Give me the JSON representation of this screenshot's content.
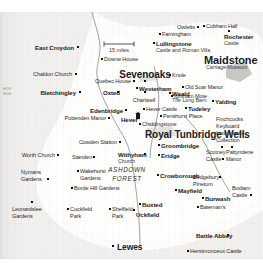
{
  "map": {
    "title": "South East England historic houses map",
    "region_label": "ASHDOWN FOREST",
    "scale": "15 miles",
    "margin_note": "HOV\nHOU",
    "colors": {
      "paper": "#f1f0ee",
      "land": "#fdfdfc",
      "text": "#1b1b1b",
      "road": "#9a9a96",
      "urban": "#b9b8b4"
    },
    "places": [
      {
        "name": "East Croydon",
        "x": 74,
        "y": 45,
        "class": "t-town",
        "align": "r",
        "marker": "dot",
        "mx": 77,
        "my": 46
      },
      {
        "name": "Downe House",
        "x": 104,
        "y": 57,
        "class": "t-site",
        "align": "l",
        "marker": "dot",
        "mx": 101,
        "my": 58
      },
      {
        "name": "Farningham",
        "x": 162,
        "y": 32,
        "class": "t-site",
        "align": "l",
        "marker": "dot",
        "mx": 159,
        "my": 33
      },
      {
        "name": "Owletts",
        "x": 195,
        "y": 25,
        "class": "t-site",
        "align": "r",
        "marker": "dot",
        "mx": 197,
        "my": 26
      },
      {
        "name": "Cobham Hall",
        "x": 206,
        "y": 24,
        "class": "t-site",
        "align": "l",
        "marker": "dot",
        "mx": 203,
        "my": 25
      },
      {
        "name": "Rochester",
        "x": 224,
        "y": 34,
        "class": "t-town",
        "align": "l",
        "marker": "dotb",
        "mx": 228,
        "my": 30
      },
      {
        "name": "Castle",
        "x": 224,
        "y": 41,
        "class": "t-sub",
        "align": "l",
        "marker": "none",
        "mx": 0,
        "my": 0
      },
      {
        "name": "Lullingstone",
        "x": 156,
        "y": 41,
        "class": "t-town",
        "align": "l",
        "marker": "dotb",
        "mx": 153,
        "my": 42
      },
      {
        "name": "Castle and Roman Villa",
        "x": 156,
        "y": 48,
        "class": "t-sub",
        "align": "l",
        "marker": "none",
        "mx": 0,
        "my": 0
      },
      {
        "name": "Maidstone",
        "x": 204,
        "y": 55,
        "class": "t-bigger",
        "align": "l",
        "marker": "none",
        "mx": 0,
        "my": 0
      },
      {
        "name": "Carriage Museum",
        "x": 206,
        "y": 65,
        "class": "t-sub",
        "align": "l",
        "marker": "none",
        "mx": 0,
        "my": 0
      },
      {
        "name": "Chaldon Church",
        "x": 72,
        "y": 72,
        "class": "t-site",
        "align": "r",
        "marker": "dot",
        "mx": 75,
        "my": 73
      },
      {
        "name": "Sevenoaks",
        "x": 145,
        "y": 70,
        "class": "t-big",
        "align": "c",
        "marker": "dotb",
        "mx": 144,
        "my": 80
      },
      {
        "name": "Knole",
        "x": 172,
        "y": 73,
        "class": "t-site",
        "align": "l",
        "marker": "dot",
        "mx": 169,
        "my": 74
      },
      {
        "name": "Quebec House",
        "x": 131,
        "y": 79,
        "class": "t-site",
        "align": "r",
        "marker": "dot",
        "mx": 133,
        "my": 80
      },
      {
        "name": "Westerham",
        "x": 139,
        "y": 86,
        "class": "t-town",
        "align": "l",
        "marker": "dot",
        "mx": 136,
        "my": 87
      },
      {
        "name": "Old Soar Manor",
        "x": 185,
        "y": 85,
        "class": "t-site",
        "align": "l",
        "marker": "dot",
        "mx": 182,
        "my": 86
      },
      {
        "name": "Ightham Mote",
        "x": 174,
        "y": 94,
        "class": "t-site",
        "align": "l",
        "marker": "dot",
        "mx": 171,
        "my": 95
      },
      {
        "name": "Bletchingley",
        "x": 76,
        "y": 90,
        "class": "t-town",
        "align": "r",
        "marker": "dot",
        "mx": 79,
        "my": 91
      },
      {
        "name": "Oxted",
        "x": 103,
        "y": 90,
        "class": "t-town",
        "align": "l",
        "marker": "dot",
        "mx": 117,
        "my": 91
      },
      {
        "name": "Chartwell",
        "x": 144,
        "y": 98,
        "class": "t-site",
        "align": "c",
        "marker": "dotb",
        "mx": 144,
        "my": 91
      },
      {
        "name": "Weald",
        "x": 172,
        "y": 91,
        "class": "t-town",
        "align": "l",
        "marker": "dotb",
        "mx": 169,
        "my": 92
      },
      {
        "name": "The Long Barn",
        "x": 172,
        "y": 98,
        "class": "t-sub",
        "align": "l",
        "marker": "none",
        "mx": 0,
        "my": 0
      },
      {
        "name": "Yalding",
        "x": 215,
        "y": 99,
        "class": "t-town",
        "align": "l",
        "marker": "dot",
        "mx": 212,
        "my": 100
      },
      {
        "name": "Edenbridge",
        "x": 123,
        "y": 108,
        "class": "t-town",
        "align": "r",
        "marker": "dot",
        "mx": 125,
        "my": 109
      },
      {
        "name": "Hever Castle",
        "x": 146,
        "y": 107,
        "class": "t-site",
        "align": "l",
        "marker": "dot",
        "mx": 143,
        "my": 108
      },
      {
        "name": "Tudeley",
        "x": 188,
        "y": 106,
        "class": "t-town",
        "align": "l",
        "marker": "dot",
        "mx": 185,
        "my": 107
      },
      {
        "name": "Puttenden Manor",
        "x": 106,
        "y": 116,
        "class": "t-site",
        "align": "r",
        "marker": "dot",
        "mx": 108,
        "my": 117
      },
      {
        "name": "Hever",
        "x": 121,
        "y": 117,
        "class": "t-town",
        "align": "l",
        "marker": "house",
        "mx": 136,
        "my": 114
      },
      {
        "name": "Penshurst Place",
        "x": 163,
        "y": 114,
        "class": "t-site",
        "align": "l",
        "marker": "dot",
        "mx": 160,
        "my": 115
      },
      {
        "name": "Chiddingstone",
        "x": 142,
        "y": 122,
        "class": "t-site",
        "align": "l",
        "marker": "dot",
        "mx": 139,
        "my": 123
      },
      {
        "name": "Royal Tunbridge Wells",
        "x": 145,
        "y": 130,
        "class": "t-big",
        "align": "l",
        "marker": "none",
        "mx": 0,
        "my": 0
      },
      {
        "name": "Finchcocks",
        "x": 216,
        "y": 117,
        "class": "t-site",
        "align": "l",
        "marker": "none",
        "mx": 0,
        "my": 0
      },
      {
        "name": "Keyboard",
        "x": 216,
        "y": 124,
        "class": "t-site",
        "align": "l",
        "marker": "none",
        "mx": 0,
        "my": 0
      },
      {
        "name": "Instruments",
        "x": 216,
        "y": 131,
        "class": "t-site",
        "align": "l",
        "marker": "none",
        "mx": 0,
        "my": 0
      },
      {
        "name": "Collection",
        "x": 216,
        "y": 138,
        "class": "t-site",
        "align": "l",
        "marker": "dot",
        "mx": 221,
        "my": 146
      },
      {
        "name": "Cowden Station",
        "x": 117,
        "y": 140,
        "class": "t-site",
        "align": "r",
        "marker": "dot",
        "mx": 119,
        "my": 141
      },
      {
        "name": "Groombridge",
        "x": 161,
        "y": 143,
        "class": "t-town",
        "align": "l",
        "marker": "dot",
        "mx": 158,
        "my": 144
      },
      {
        "name": "Scotney",
        "x": 206,
        "y": 150,
        "class": "t-site",
        "align": "l",
        "marker": "none",
        "mx": 0,
        "my": 0
      },
      {
        "name": "Castle",
        "x": 206,
        "y": 157,
        "class": "t-site",
        "align": "l",
        "marker": "dot",
        "mx": 222,
        "my": 158
      },
      {
        "name": "Pattyndene",
        "x": 226,
        "y": 150,
        "class": "t-site",
        "align": "l",
        "marker": "dot",
        "mx": 231,
        "my": 146
      },
      {
        "name": "Manor",
        "x": 226,
        "y": 157,
        "class": "t-site",
        "align": "l",
        "marker": "none",
        "mx": 0,
        "my": 0
      },
      {
        "name": "Withyham",
        "x": 118,
        "y": 152,
        "class": "t-town",
        "align": "l",
        "marker": "dot",
        "mx": 144,
        "my": 153
      },
      {
        "name": "Church",
        "x": 118,
        "y": 159,
        "class": "t-sub",
        "align": "l",
        "marker": "none",
        "mx": 0,
        "my": 0
      },
      {
        "name": "Eridge",
        "x": 161,
        "y": 153,
        "class": "t-town",
        "align": "l",
        "marker": "dot",
        "mx": 158,
        "my": 154
      },
      {
        "name": "Worth Church",
        "x": 55,
        "y": 153,
        "class": "t-site",
        "align": "r",
        "marker": "dot",
        "mx": 57,
        "my": 154
      },
      {
        "name": "Standen",
        "x": 72,
        "y": 155,
        "class": "t-site",
        "align": "l",
        "marker": "dot",
        "mx": 93,
        "my": 156
      },
      {
        "name": "Nymans",
        "x": 21,
        "y": 170,
        "class": "t-site",
        "align": "l",
        "marker": "none",
        "mx": 0,
        "my": 0
      },
      {
        "name": "Gardens",
        "x": 21,
        "y": 177,
        "class": "t-site",
        "align": "l",
        "marker": "dot",
        "mx": 47,
        "my": 178
      },
      {
        "name": "Wakehurst",
        "x": 80,
        "y": 169,
        "class": "t-site",
        "align": "l",
        "marker": "dot",
        "mx": 77,
        "my": 170
      },
      {
        "name": "Gardens",
        "x": 80,
        "y": 176,
        "class": "t-site",
        "align": "l",
        "marker": "none",
        "mx": 0,
        "my": 0
      },
      {
        "name": "Borde Hill Gardens",
        "x": 74,
        "y": 186,
        "class": "t-site",
        "align": "l",
        "marker": "dot",
        "mx": 71,
        "my": 187
      },
      {
        "name": "ASHDOWN",
        "x": 127,
        "y": 167,
        "class": "t-forest",
        "align": "c",
        "marker": "none",
        "mx": 0,
        "my": 0
      },
      {
        "name": "FOREST",
        "x": 127,
        "y": 176,
        "class": "t-forest",
        "align": "c",
        "marker": "none",
        "mx": 0,
        "my": 0
      },
      {
        "name": "Crowborough",
        "x": 160,
        "y": 173,
        "class": "t-town",
        "align": "l",
        "marker": "dot",
        "mx": 157,
        "my": 174
      },
      {
        "name": "Mayfield",
        "x": 178,
        "y": 188,
        "class": "t-town",
        "align": "l",
        "marker": "dot",
        "mx": 175,
        "my": 189
      },
      {
        "name": "Bedgebury",
        "x": 193,
        "y": 175,
        "class": "t-site",
        "align": "l",
        "marker": "dot",
        "mx": 219,
        "my": 176
      },
      {
        "name": "Pinetum",
        "x": 193,
        "y": 182,
        "class": "t-site",
        "align": "l",
        "marker": "none",
        "mx": 0,
        "my": 0
      },
      {
        "name": "Bodiam",
        "x": 232,
        "y": 186,
        "class": "t-site",
        "align": "l",
        "marker": "none",
        "mx": 0,
        "my": 0
      },
      {
        "name": "Castle",
        "x": 232,
        "y": 193,
        "class": "t-site",
        "align": "l",
        "marker": "dot",
        "mx": 250,
        "my": 194
      },
      {
        "name": "Burwash",
        "x": 205,
        "y": 196,
        "class": "t-town",
        "align": "l",
        "marker": "dot",
        "mx": 202,
        "my": 197
      },
      {
        "name": "Bateman's",
        "x": 200,
        "y": 205,
        "class": "t-site",
        "align": "l",
        "marker": "dot",
        "mx": 197,
        "my": 206
      },
      {
        "name": "Leonardslee",
        "x": 12,
        "y": 207,
        "class": "t-site",
        "align": "l",
        "marker": "dot",
        "mx": 31,
        "my": 201
      },
      {
        "name": "Gardens",
        "x": 12,
        "y": 214,
        "class": "t-site",
        "align": "l",
        "marker": "none",
        "mx": 0,
        "my": 0
      },
      {
        "name": "Cuckfield",
        "x": 70,
        "y": 207,
        "class": "t-site",
        "align": "l",
        "marker": "dot",
        "mx": 67,
        "my": 208
      },
      {
        "name": "Park",
        "x": 70,
        "y": 214,
        "class": "t-site",
        "align": "l",
        "marker": "none",
        "mx": 0,
        "my": 0
      },
      {
        "name": "Sheffield",
        "x": 112,
        "y": 207,
        "class": "t-site",
        "align": "l",
        "marker": "dot",
        "mx": 109,
        "my": 208
      },
      {
        "name": "Park",
        "x": 112,
        "y": 214,
        "class": "t-site",
        "align": "l",
        "marker": "none",
        "mx": 0,
        "my": 0
      },
      {
        "name": "Buxted",
        "x": 142,
        "y": 202,
        "class": "t-town",
        "align": "l",
        "marker": "dot",
        "mx": 139,
        "my": 203
      },
      {
        "name": "Uckfield",
        "x": 136,
        "y": 212,
        "class": "t-town",
        "align": "l",
        "marker": "dot",
        "mx": 133,
        "my": 209
      },
      {
        "name": "Lewes",
        "x": 117,
        "y": 243,
        "class": "t-city",
        "align": "l",
        "marker": "dotb",
        "mx": 112,
        "my": 245
      },
      {
        "name": "Battle Abbey",
        "x": 196,
        "y": 233,
        "class": "t-town",
        "align": "l",
        "marker": "dot",
        "mx": 227,
        "my": 234
      },
      {
        "name": "Herstmonceux Castle",
        "x": 190,
        "y": 249,
        "class": "t-site",
        "align": "l",
        "marker": "dot",
        "mx": 187,
        "my": 250
      }
    ]
  }
}
